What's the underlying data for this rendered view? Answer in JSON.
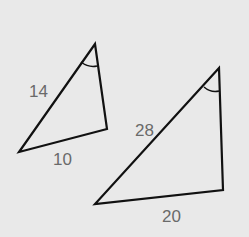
{
  "diagram": {
    "background": "#e9e9e9",
    "stroke_color": "#111111",
    "label_color": "#6a6a6a",
    "triangles": [
      {
        "name": "small-triangle",
        "vertices": {
          "top": [
            95,
            44
          ],
          "right": [
            107,
            129
          ],
          "left": [
            19,
            152
          ]
        },
        "side_labels": {
          "hypotenuse": "14",
          "base": "10"
        },
        "angle_mark_at": "top"
      },
      {
        "name": "large-triangle",
        "vertices": {
          "top": [
            219,
            68
          ],
          "right": [
            223,
            190
          ],
          "left": [
            95,
            204
          ]
        },
        "side_labels": {
          "hypotenuse": "28",
          "base": "20"
        },
        "angle_mark_at": "top"
      }
    ]
  }
}
